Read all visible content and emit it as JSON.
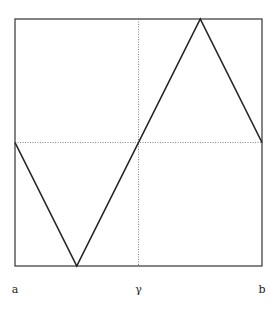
{
  "chart_data": {
    "type": "line",
    "title": "",
    "xlabel": "",
    "ylabel": "",
    "x_tick_labels": [
      {
        "label": "a",
        "x": 0
      },
      {
        "label": "γ",
        "x": 0.5
      },
      {
        "label": "b",
        "x": 1
      }
    ],
    "xlim": [
      0,
      1
    ],
    "ylim": [
      -1,
      1
    ],
    "reference_lines": [
      {
        "orientation": "vertical",
        "x": 0.5,
        "style": "dotted"
      },
      {
        "orientation": "horizontal",
        "y": 0,
        "style": "dotted"
      }
    ],
    "series": [
      {
        "name": "zigzag",
        "points": [
          [
            0,
            0
          ],
          [
            0.25,
            -1
          ],
          [
            0.75,
            1
          ],
          [
            1,
            0
          ]
        ]
      }
    ]
  }
}
